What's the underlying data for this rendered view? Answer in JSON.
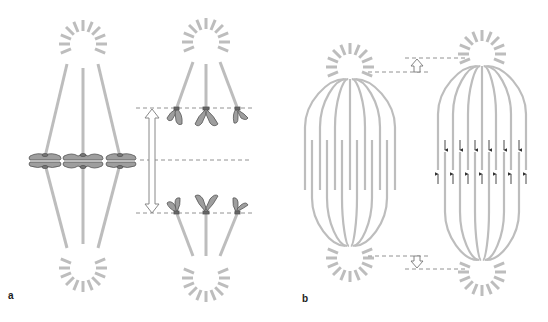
{
  "figure": {
    "panels": [
      {
        "id": "a",
        "label": "a",
        "description": "Anaphase A: chromosomes at metaphase plate, then sister chromatids pulled to poles (kinetochore microtubules shorten)"
      },
      {
        "id": "b",
        "label": "b",
        "description": "Anaphase B: overlapping polar microtubules slide apart, spindle poles move apart"
      }
    ],
    "colors": {
      "microtubule": "#bdbdbd",
      "aster": "#bdbdbd",
      "chromosome_fill": "#9e9e9e",
      "chromosome_stroke": "#555555",
      "dashed_line": "#777777",
      "arrow_outline": "#888888",
      "small_arrow": "#333333"
    }
  }
}
